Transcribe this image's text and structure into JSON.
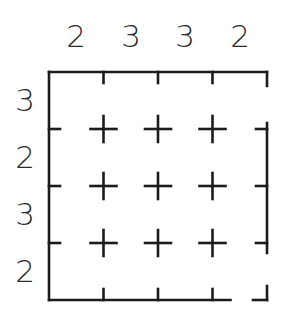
{
  "figure": {
    "name": "grid-clue-puzzle",
    "type": "puzzle-grid",
    "grid": {
      "columns": 4,
      "rows": 4,
      "interior_cross_columns": 3,
      "interior_cross_rows": 3
    },
    "geometry": {
      "box_left": 49,
      "box_top": 72,
      "box_right": 267,
      "box_bottom": 300,
      "cell_width": 54.5,
      "cell_height": 57,
      "stroke_color": "#1c1c1c",
      "stroke_width": 2.6,
      "background_color": "#ffffff"
    },
    "column_clues": [
      {
        "index": 0,
        "value": "2",
        "center_x": 76
      },
      {
        "index": 1,
        "value": "3",
        "center_x": 131
      },
      {
        "index": 2,
        "value": "3",
        "center_x": 185
      },
      {
        "index": 3,
        "value": "2",
        "center_x": 240
      }
    ],
    "row_clues": [
      {
        "index": 0,
        "value": "3",
        "center_y": 100
      },
      {
        "index": 1,
        "value": "2",
        "center_y": 157
      },
      {
        "index": 2,
        "value": "3",
        "center_y": 214
      },
      {
        "index": 3,
        "value": "2",
        "center_y": 271
      }
    ],
    "cross_markers": [
      {
        "row": 0,
        "col": 0,
        "x": 103.5,
        "y": 129
      },
      {
        "row": 0,
        "col": 1,
        "x": 158,
        "y": 129
      },
      {
        "row": 0,
        "col": 2,
        "x": 212.5,
        "y": 129
      },
      {
        "row": 1,
        "col": 0,
        "x": 103.5,
        "y": 186
      },
      {
        "row": 1,
        "col": 1,
        "x": 158,
        "y": 186
      },
      {
        "row": 1,
        "col": 2,
        "x": 212.5,
        "y": 186
      },
      {
        "row": 2,
        "col": 0,
        "x": 103.5,
        "y": 243
      },
      {
        "row": 2,
        "col": 1,
        "x": 158,
        "y": 243
      },
      {
        "row": 2,
        "col": 2,
        "x": 212.5,
        "y": 243
      }
    ],
    "cross_arm_length": 13
  },
  "chart_data": {
    "type": "table",
    "title": "",
    "xlabel": "",
    "ylabel": "",
    "categories": [
      "col1",
      "col2",
      "col3",
      "col4"
    ],
    "column_values": [
      2,
      3,
      3,
      2
    ],
    "row_categories": [
      "row1",
      "row2",
      "row3",
      "row4"
    ],
    "row_values": [
      3,
      2,
      3,
      2
    ],
    "grid": true,
    "legend": "none"
  }
}
